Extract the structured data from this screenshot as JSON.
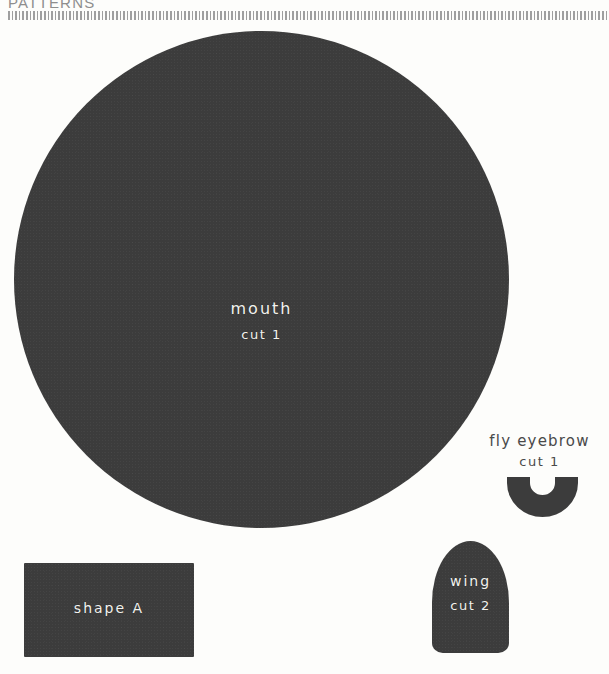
{
  "header": {
    "title": "PATTERNS",
    "rule_style": "dashed"
  },
  "colors": {
    "piece_fill": "#3c3c3c",
    "page_background": "#fdfdfb",
    "light_label": "#f2f2ee",
    "dark_label": "#4a4a4a",
    "rule": "#9a9a9a"
  },
  "pieces": [
    {
      "id": "mouth",
      "shape": "circle",
      "name": "mouth",
      "cut": "cut 1",
      "label_color": "light"
    },
    {
      "id": "shape-a",
      "shape": "rectangle",
      "name": "shape A",
      "cut": "",
      "label_color": "light"
    },
    {
      "id": "wing",
      "shape": "dome",
      "name": "wing",
      "cut": "cut 2",
      "label_color": "light"
    },
    {
      "id": "fly-eyebrow",
      "shape": "u-arch",
      "name": "fly eyebrow",
      "cut": "cut 1",
      "label_color": "dark"
    }
  ]
}
